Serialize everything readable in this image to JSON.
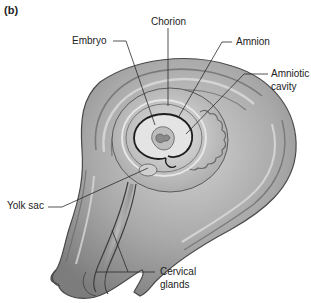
{
  "figure": {
    "panel_label": "(b)",
    "labels": {
      "chorion": "Chorion",
      "embryo": "Embryo",
      "amnion": "Amnion",
      "amniotic_cavity_line1": "Amniotic",
      "amniotic_cavity_line2": "cavity",
      "yolk_sac": "Yolk sac",
      "cervical_glands_line1": "Cervical",
      "cervical_glands_line2": "glands"
    },
    "colors": {
      "background": "#ffffff",
      "tissue_dark": "#6e6e6e",
      "tissue_mid": "#9a9a9a",
      "tissue_light": "#c4c4c4",
      "tissue_highlight": "#dcdcdc",
      "outline": "#4a4a4a",
      "membrane": "#1e1e1e",
      "leader_line": "#2a2a2a",
      "text": "#222222"
    }
  }
}
